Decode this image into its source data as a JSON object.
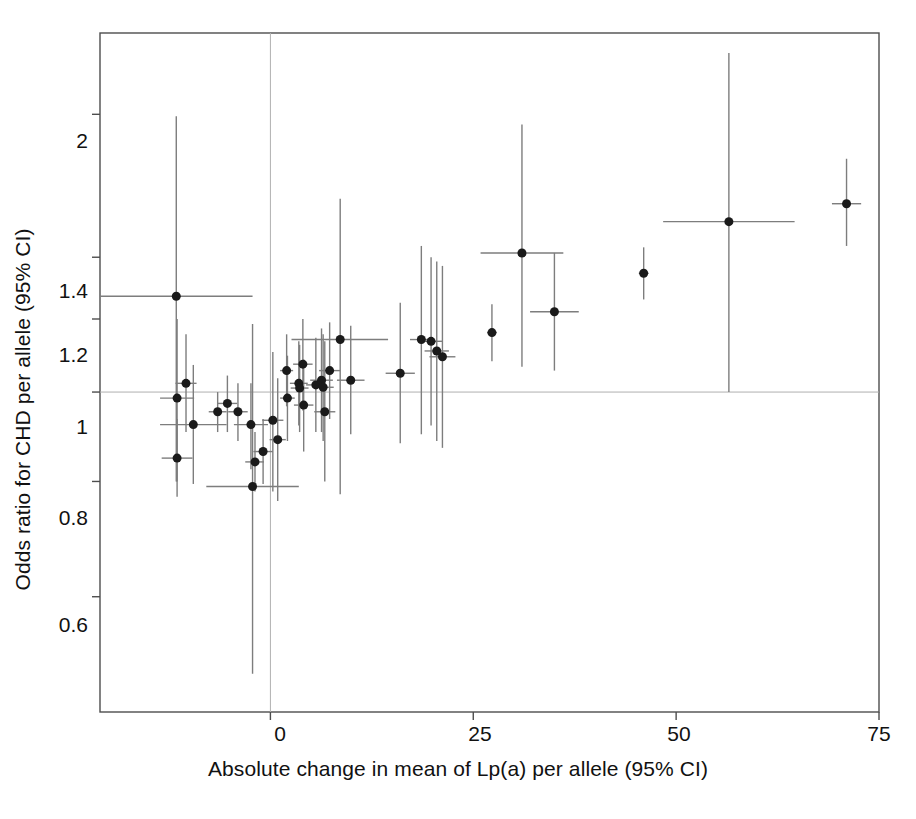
{
  "chart_data": {
    "type": "scatter",
    "title": "",
    "xlabel": "Absolute change in mean of Lp(a) per allele (95% CI)",
    "ylabel": "Odds ratio for CHD per allele (95% CI)",
    "xlim": [
      -21.0,
      75.0
    ],
    "ylim": [
      0.45,
      2.45
    ],
    "yscale": "log",
    "xscale": "linear",
    "grid": false,
    "legend": null,
    "xticks": [
      0,
      25,
      50,
      75
    ],
    "xticklabels": [
      "0",
      "25",
      "50",
      "75"
    ],
    "yticks": [
      0.6,
      0.8,
      1,
      1.2,
      1.4,
      2
    ],
    "yticklabels": [
      "0.6",
      "0.8",
      "1",
      "1.2",
      "1.4",
      "2"
    ],
    "reference_lines": [
      {
        "axis": "y",
        "value": 1.0,
        "style": "thin-grey"
      },
      {
        "axis": "x",
        "value": 0.0,
        "style": "thin-grey"
      }
    ],
    "marker": {
      "shape": "circle",
      "color": "#1a1a1a",
      "size_px": 9
    },
    "errorbar": {
      "color": "#7d7d7d",
      "width_px": 1.4
    },
    "point_count": 38,
    "points": [
      {
        "x": -11.6,
        "x_lo": -21.0,
        "x_hi": -2.2,
        "y": 1.27,
        "y_lo": 0.8,
        "y_hi": 1.99
      },
      {
        "x": -11.5,
        "x_lo": -13.6,
        "x_hi": -9.4,
        "y": 0.985,
        "y_lo": 0.8,
        "y_hi": 1.2
      },
      {
        "x": -11.5,
        "x_lo": -13.4,
        "x_hi": -9.6,
        "y": 0.848,
        "y_lo": 0.77,
        "y_hi": 0.935
      },
      {
        "x": -10.4,
        "x_lo": -11.7,
        "x_hi": -9.1,
        "y": 1.022,
        "y_lo": 0.905,
        "y_hi": 1.155
      },
      {
        "x": -9.5,
        "x_lo": -13.6,
        "x_hi": -5.4,
        "y": 0.922,
        "y_lo": 0.795,
        "y_hi": 1.07
      },
      {
        "x": -6.5,
        "x_lo": -7.6,
        "x_hi": -5.4,
        "y": 0.952,
        "y_lo": 0.905,
        "y_hi": 1.0
      },
      {
        "x": -5.3,
        "x_lo": -6.5,
        "x_hi": -4.1,
        "y": 0.972,
        "y_lo": 0.905,
        "y_hi": 1.042
      },
      {
        "x": -4.0,
        "x_lo": -5.2,
        "x_hi": -2.8,
        "y": 0.952,
        "y_lo": 0.885,
        "y_hi": 1.022
      },
      {
        "x": -2.4,
        "x_lo": -4.5,
        "x_hi": -0.3,
        "y": 0.922,
        "y_lo": 0.825,
        "y_hi": 1.022
      },
      {
        "x": -2.2,
        "x_lo": -7.9,
        "x_hi": 3.5,
        "y": 0.79,
        "y_lo": 0.495,
        "y_hi": 1.185
      },
      {
        "x": -1.9,
        "x_lo": -3.1,
        "x_hi": -0.8,
        "y": 0.84,
        "y_lo": 0.78,
        "y_hi": 0.905
      },
      {
        "x": -0.9,
        "x_lo": -2.1,
        "x_hi": 0.3,
        "y": 0.862,
        "y_lo": 0.795,
        "y_hi": 0.935
      },
      {
        "x": 0.3,
        "x_lo": -1.0,
        "x_hi": 1.6,
        "y": 0.932,
        "y_lo": 0.78,
        "y_hi": 1.105
      },
      {
        "x": 0.9,
        "x_lo": -0.1,
        "x_hi": 1.9,
        "y": 0.888,
        "y_lo": 0.762,
        "y_hi": 1.035
      },
      {
        "x": 2.0,
        "x_lo": 1.2,
        "x_hi": 2.8,
        "y": 1.055,
        "y_lo": 0.965,
        "y_hi": 1.155
      },
      {
        "x": 2.1,
        "x_lo": 1.2,
        "x_hi": 3.0,
        "y": 0.985,
        "y_lo": 0.885,
        "y_hi": 1.095
      },
      {
        "x": 3.5,
        "x_lo": 2.4,
        "x_hi": 4.6,
        "y": 1.022,
        "y_lo": 0.92,
        "y_hi": 1.135
      },
      {
        "x": 3.6,
        "x_lo": 2.5,
        "x_hi": 4.7,
        "y": 1.01,
        "y_lo": 0.905,
        "y_hi": 1.125
      },
      {
        "x": 4.0,
        "x_lo": 2.8,
        "x_hi": 5.2,
        "y": 1.072,
        "y_lo": 0.955,
        "y_hi": 1.2
      },
      {
        "x": 4.1,
        "x_lo": 2.9,
        "x_hi": 5.3,
        "y": 0.968,
        "y_lo": 0.862,
        "y_hi": 1.085
      },
      {
        "x": 5.6,
        "x_lo": 4.4,
        "x_hi": 6.8,
        "y": 1.018,
        "y_lo": 0.905,
        "y_hi": 1.145
      },
      {
        "x": 6.3,
        "x_lo": 4.9,
        "x_hi": 7.7,
        "y": 1.03,
        "y_lo": 0.905,
        "y_hi": 1.172
      },
      {
        "x": 6.5,
        "x_lo": 5.2,
        "x_hi": 7.8,
        "y": 1.012,
        "y_lo": 0.885,
        "y_hi": 1.155
      },
      {
        "x": 6.7,
        "x_lo": 5.4,
        "x_hi": 8.0,
        "y": 0.952,
        "y_lo": 0.8,
        "y_hi": 1.135
      },
      {
        "x": 7.3,
        "x_lo": 6.0,
        "x_hi": 8.6,
        "y": 1.055,
        "y_lo": 0.935,
        "y_hi": 1.19
      },
      {
        "x": 8.6,
        "x_lo": 2.6,
        "x_hi": 14.5,
        "y": 1.14,
        "y_lo": 0.775,
        "y_hi": 1.62
      },
      {
        "x": 9.9,
        "x_lo": 8.2,
        "x_hi": 11.6,
        "y": 1.03,
        "y_lo": 0.9,
        "y_hi": 1.18
      },
      {
        "x": 16.0,
        "x_lo": 14.2,
        "x_hi": 17.8,
        "y": 1.048,
        "y_lo": 0.88,
        "y_hi": 1.25
      },
      {
        "x": 18.6,
        "x_lo": 17.2,
        "x_hi": 20.0,
        "y": 1.14,
        "y_lo": 0.9,
        "y_hi": 1.44
      },
      {
        "x": 19.8,
        "x_lo": 18.4,
        "x_hi": 21.2,
        "y": 1.135,
        "y_lo": 0.92,
        "y_hi": 1.4
      },
      {
        "x": 20.5,
        "x_lo": 19.0,
        "x_hi": 22.0,
        "y": 1.108,
        "y_lo": 0.885,
        "y_hi": 1.385
      },
      {
        "x": 21.2,
        "x_lo": 19.6,
        "x_hi": 22.8,
        "y": 1.092,
        "y_lo": 0.87,
        "y_hi": 1.37
      },
      {
        "x": 27.3,
        "x_lo": 26.7,
        "x_hi": 27.9,
        "y": 1.16,
        "y_lo": 1.08,
        "y_hi": 1.245
      },
      {
        "x": 31.0,
        "x_lo": 25.9,
        "x_hi": 36.1,
        "y": 1.415,
        "y_lo": 1.065,
        "y_hi": 1.95
      },
      {
        "x": 35.0,
        "x_lo": 32.0,
        "x_hi": 38.0,
        "y": 1.222,
        "y_lo": 1.055,
        "y_hi": 1.415
      },
      {
        "x": 46.0,
        "x_lo": 45.4,
        "x_hi": 46.6,
        "y": 1.345,
        "y_lo": 1.26,
        "y_hi": 1.435
      },
      {
        "x": 56.5,
        "x_lo": 48.4,
        "x_hi": 64.6,
        "y": 1.53,
        "y_lo": 1.0,
        "y_hi": 2.33
      },
      {
        "x": 71.0,
        "x_lo": 69.2,
        "x_hi": 72.8,
        "y": 1.6,
        "y_lo": 1.44,
        "y_hi": 1.79
      }
    ]
  },
  "axes": {
    "x_title": "Absolute change in mean of Lp(a) per allele (95% CI)",
    "y_title": "Odds ratio for CHD per allele (95% CI)",
    "x_tick_labels": [
      "0",
      "25",
      "50",
      "75"
    ],
    "y_tick_labels": [
      "2",
      "1.4",
      "1.2",
      "1",
      "0.8",
      "0.6"
    ]
  },
  "colors": {
    "marker": "#1a1a1a",
    "errorbar": "#7d7d7d",
    "frame": "#4d4d4d",
    "reference": "#b0b0b0",
    "background": "#ffffff",
    "text": "#111111"
  }
}
